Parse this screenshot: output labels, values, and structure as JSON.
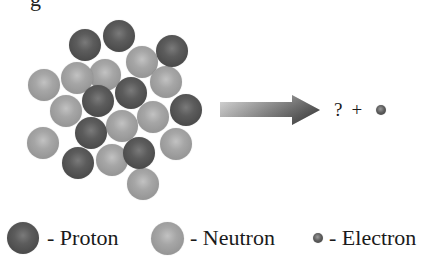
{
  "figure": {
    "top_fragment": "g",
    "nucleus": {
      "ball_radius": 16,
      "protons": [
        {
          "x": 85,
          "y": 45
        },
        {
          "x": 119,
          "y": 36
        },
        {
          "x": 172,
          "y": 51
        },
        {
          "x": 98,
          "y": 101
        },
        {
          "x": 131,
          "y": 93
        },
        {
          "x": 186,
          "y": 110
        },
        {
          "x": 91,
          "y": 133
        },
        {
          "x": 78,
          "y": 163
        },
        {
          "x": 139,
          "y": 153
        }
      ],
      "neutrons": [
        {
          "x": 105,
          "y": 75
        },
        {
          "x": 142,
          "y": 62
        },
        {
          "x": 166,
          "y": 82
        },
        {
          "x": 44,
          "y": 85
        },
        {
          "x": 77,
          "y": 78
        },
        {
          "x": 66,
          "y": 111
        },
        {
          "x": 122,
          "y": 126
        },
        {
          "x": 153,
          "y": 117
        },
        {
          "x": 43,
          "y": 143
        },
        {
          "x": 112,
          "y": 160
        },
        {
          "x": 176,
          "y": 144
        },
        {
          "x": 143,
          "y": 184
        }
      ]
    },
    "arrow": {
      "direction": "right",
      "icon": "reaction-arrow-icon"
    },
    "products": {
      "unknown": "?",
      "plus": "+",
      "particle": "electron"
    },
    "legend": [
      {
        "label": "- Proton",
        "type": "proton"
      },
      {
        "label": "- Neutron",
        "type": "neutron"
      },
      {
        "label": "- Electron",
        "type": "electron"
      }
    ],
    "colors": {
      "proton": "#555555",
      "neutron": "#a0a0a0",
      "electron": "#505050",
      "arrow_dark": "#4a4a4a",
      "arrow_light": "#cfcfcf"
    }
  }
}
